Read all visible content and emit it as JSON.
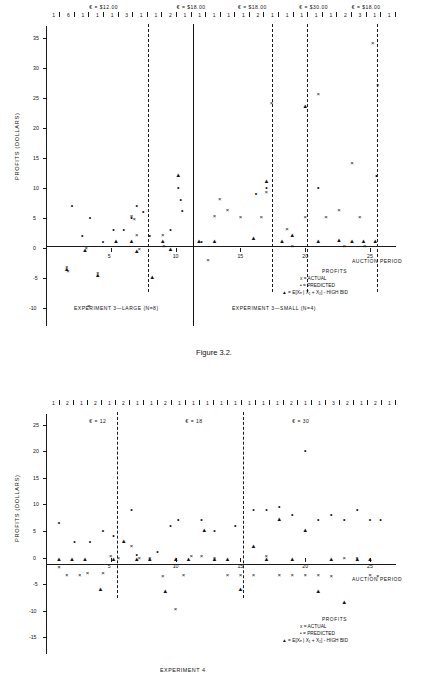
{
  "figure1": {
    "caption": "Figure 3.2.",
    "ylabel": "PROFITS (DOLLARS)",
    "xlabel": "AUCTION PERIOD",
    "y_ticks": [
      "35",
      "30",
      "25",
      "20",
      "15",
      "10",
      "5",
      "0",
      "-5",
      "-10"
    ],
    "x_ticks": [
      "5",
      "10",
      "15",
      "20",
      "25"
    ],
    "top_labels": [
      {
        "text": "€ = $12.00",
        "x": 0.175
      },
      {
        "text": "€ = $18.00",
        "x": 0.425
      },
      {
        "text": "€ = $18.00",
        "x": 0.6
      },
      {
        "text": "€ = $30.00",
        "x": 0.775
      },
      {
        "text": "€ = $18.00",
        "x": 0.925
      }
    ],
    "top_numbers": [
      "1",
      "6",
      "1",
      "1",
      "1",
      "3",
      "1",
      "1",
      "2",
      "1",
      "1",
      "1",
      "1",
      "1",
      "2",
      "1",
      "1",
      "1",
      "1",
      "1",
      "2",
      "3",
      "1",
      "1"
    ],
    "left_label": "EXPERIMENT 3—LARGE (N=8)",
    "right_label": "EXPERIMENT 3—SMALL (N=4)",
    "legend": {
      "title": "PROFITS",
      "items": [
        "x = ACTUAL",
        "• = PREDICTED",
        "▲ = E[Xₑ | X₁ + X₂] - HIGH BID"
      ]
    }
  },
  "figure2": {
    "ylabel": "PROFITS (DOLLARS)",
    "xlabel": "AUCTION PERIOD",
    "y_ticks": [
      "25",
      "20",
      "15",
      "10",
      "5",
      "0",
      "-5",
      "-10",
      "-15"
    ],
    "x_ticks": [
      "5",
      "10",
      "15",
      "20",
      "25"
    ],
    "top_labels": [
      {
        "text": "€ = 12",
        "x": 0.175
      },
      {
        "text": "€ = 18",
        "x": 0.45
      },
      {
        "text": "€ = 30",
        "x": 0.755
      }
    ],
    "top_numbers": [
      "1",
      "2",
      "1",
      "2",
      "1",
      "2",
      "1",
      "1",
      "2",
      "1",
      "1",
      "1",
      "1",
      "1",
      "1",
      "1",
      "1",
      "2",
      "1",
      "1",
      "3",
      "2",
      "1",
      "2",
      "1"
    ],
    "bottom_label": "EXPERIMENT  4",
    "legend": {
      "title": "PROFITS",
      "items": [
        "x = ACTUAL",
        "• = PREDICTED",
        "▲ = E[Xₑ | X₁ + X₂] - HIGH BID"
      ]
    }
  },
  "chart_data": [
    {
      "type": "scatter",
      "title": "Figure 3.2. Experiment 3 — Large (N=8) and Small (N=4)",
      "xlabel": "AUCTION PERIOD",
      "ylabel": "PROFITS (DOLLARS)",
      "xlim": [
        0,
        27
      ],
      "ylim": [
        -12,
        37
      ],
      "grid": false,
      "legend_position": "bottom-right",
      "series": [
        {
          "name": "ACTUAL",
          "marker": "x",
          "points": [
            [
              1.6,
              -3.4
            ],
            [
              1.7,
              -4.0
            ],
            [
              3.1,
              -0.2
            ],
            [
              3.3,
              -9.8
            ],
            [
              4.0,
              -4.3
            ],
            [
              6.6,
              5.1
            ],
            [
              6.8,
              4.6
            ],
            [
              7.0,
              2.0
            ],
            [
              7.2,
              -0.3
            ],
            [
              9.0,
              2.0
            ],
            [
              9.1,
              0.2
            ],
            [
              12.5,
              -2.2
            ],
            [
              13.0,
              5.1
            ],
            [
              13.4,
              8.0
            ],
            [
              14.0,
              6.1
            ],
            [
              15.0,
              5.0
            ],
            [
              16.6,
              5.0
            ],
            [
              17.0,
              9.1
            ],
            [
              17.4,
              24.0
            ],
            [
              18.6,
              3.0
            ],
            [
              19.0,
              0.2
            ],
            [
              20.0,
              5.0
            ],
            [
              21.0,
              25.5
            ],
            [
              21.6,
              5.0
            ],
            [
              22.6,
              6.1
            ],
            [
              23.0,
              0.2
            ],
            [
              23.6,
              14.0
            ],
            [
              24.2,
              5.0
            ],
            [
              24.6,
              0.2
            ],
            [
              25.2,
              34.0
            ],
            [
              25.6,
              27.0
            ]
          ]
        },
        {
          "name": "PREDICTED",
          "marker": "dot",
          "points": [
            [
              2.0,
              7.0
            ],
            [
              2.8,
              2.0
            ],
            [
              3.4,
              5.0
            ],
            [
              4.4,
              1.0
            ],
            [
              5.2,
              3.0
            ],
            [
              6.0,
              3.0
            ],
            [
              6.6,
              5.0
            ],
            [
              7.0,
              7.0
            ],
            [
              7.5,
              6.0
            ],
            [
              8.0,
              2.0
            ],
            [
              9.6,
              3.0
            ],
            [
              10.2,
              10.0
            ],
            [
              10.4,
              8.0
            ],
            [
              10.5,
              6.1
            ],
            [
              12.0,
              1.0
            ],
            [
              16.2,
              9.0
            ],
            [
              17.0,
              10.0
            ],
            [
              21.0,
              10.0
            ],
            [
              25.5,
              12.0
            ]
          ]
        },
        {
          "name": "E[Xe|X1+X2]-HIGH BID",
          "marker": "triangle",
          "points": [
            [
              1.6,
              -3.6
            ],
            [
              3.0,
              -0.5
            ],
            [
              4.0,
              -4.6
            ],
            [
              5.4,
              1.0
            ],
            [
              6.6,
              1.0
            ],
            [
              7.0,
              -0.6
            ],
            [
              8.2,
              -5.0
            ],
            [
              9.0,
              1.0
            ],
            [
              9.6,
              -0.4
            ],
            [
              10.2,
              12.0
            ],
            [
              11.8,
              1.0
            ],
            [
              13.0,
              1.0
            ],
            [
              16.0,
              1.5
            ],
            [
              17.0,
              11.0
            ],
            [
              18.2,
              1.0
            ],
            [
              19.0,
              2.0
            ],
            [
              20.0,
              23.5
            ],
            [
              21.0,
              1.0
            ],
            [
              22.6,
              1.2
            ],
            [
              23.6,
              1.0
            ],
            [
              24.5,
              1.0
            ],
            [
              25.4,
              1.0
            ]
          ]
        }
      ]
    },
    {
      "type": "scatter",
      "title": "Experiment 4",
      "xlabel": "AUCTION PERIOD",
      "ylabel": "PROFITS (DOLLARS)",
      "xlim": [
        0,
        27
      ],
      "ylim": [
        -17,
        27
      ],
      "grid": false,
      "legend_position": "bottom-right",
      "series": [
        {
          "name": "ACTUAL",
          "marker": "x",
          "points": [
            [
              1.0,
              -2.0
            ],
            [
              1.6,
              -3.4
            ],
            [
              2.6,
              -3.4
            ],
            [
              3.2,
              -3.0
            ],
            [
              4.4,
              -3.0
            ],
            [
              5.0,
              0.2
            ],
            [
              5.6,
              -0.2
            ],
            [
              6.6,
              2.0
            ],
            [
              7.2,
              -0.2
            ],
            [
              8.0,
              -0.2
            ],
            [
              9.0,
              -3.6
            ],
            [
              10.0,
              -9.8
            ],
            [
              10.6,
              -3.4
            ],
            [
              11.2,
              0.2
            ],
            [
              12.0,
              0.2
            ],
            [
              13.0,
              -0.2
            ],
            [
              14.0,
              -3.4
            ],
            [
              15.0,
              -3.4
            ],
            [
              16.0,
              -3.4
            ],
            [
              17.0,
              0.2
            ],
            [
              18.0,
              -3.4
            ],
            [
              19.0,
              -3.4
            ],
            [
              20.0,
              -3.4
            ],
            [
              21.0,
              -3.4
            ],
            [
              22.0,
              -3.6
            ],
            [
              23.0,
              -0.2
            ],
            [
              24.0,
              -0.2
            ],
            [
              25.0,
              -3.4
            ],
            [
              25.6,
              -3.6
            ]
          ]
        },
        {
          "name": "PREDICTED",
          "marker": "dot",
          "points": [
            [
              1.0,
              6.5
            ],
            [
              2.2,
              3.0
            ],
            [
              3.4,
              3.0
            ],
            [
              4.4,
              5.0
            ],
            [
              5.2,
              4.0
            ],
            [
              6.6,
              9.0
            ],
            [
              7.0,
              0.5
            ],
            [
              8.6,
              1.0
            ],
            [
              9.6,
              6.0
            ],
            [
              10.2,
              7.0
            ],
            [
              12.0,
              7.0
            ],
            [
              13.0,
              5.0
            ],
            [
              14.6,
              6.0
            ],
            [
              16.0,
              9.0
            ],
            [
              17.0,
              9.0
            ],
            [
              18.0,
              9.5
            ],
            [
              19.0,
              8.0
            ],
            [
              20.0,
              20.0
            ],
            [
              21.0,
              7.0
            ],
            [
              22.0,
              8.0
            ],
            [
              23.0,
              7.0
            ],
            [
              24.0,
              9.0
            ],
            [
              25.0,
              7.0
            ],
            [
              25.8,
              7.0
            ]
          ]
        },
        {
          "name": "E[Xe|X1+X2]-HIGH BID",
          "marker": "triangle",
          "points": [
            [
              1.0,
              -0.5
            ],
            [
              2.0,
              -0.5
            ],
            [
              3.0,
              -0.5
            ],
            [
              4.2,
              -6.0
            ],
            [
              5.2,
              -0.4
            ],
            [
              6.0,
              3.0
            ],
            [
              7.0,
              -0.5
            ],
            [
              8.0,
              -0.5
            ],
            [
              9.2,
              -6.5
            ],
            [
              10.0,
              -0.5
            ],
            [
              11.0,
              -0.5
            ],
            [
              12.2,
              5.0
            ],
            [
              13.0,
              -0.5
            ],
            [
              14.0,
              -0.5
            ],
            [
              15.0,
              -6.0
            ],
            [
              16.0,
              2.0
            ],
            [
              17.0,
              -0.5
            ],
            [
              18.0,
              7.0
            ],
            [
              19.0,
              -0.5
            ],
            [
              20.0,
              5.0
            ],
            [
              21.0,
              -6.5
            ],
            [
              22.0,
              -0.5
            ],
            [
              23.0,
              -8.5
            ],
            [
              24.0,
              -0.5
            ],
            [
              25.0,
              -0.5
            ]
          ]
        }
      ]
    }
  ]
}
